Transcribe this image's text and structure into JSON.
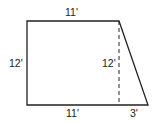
{
  "diagram": {
    "shape": "trapezoid",
    "colors": {
      "stroke": "#222222",
      "background": "#ffffff"
    },
    "labels": {
      "top": "11'",
      "left": "12'",
      "height_dashed": "12'",
      "bottom_left": "11'",
      "bottom_right": "3'"
    }
  }
}
